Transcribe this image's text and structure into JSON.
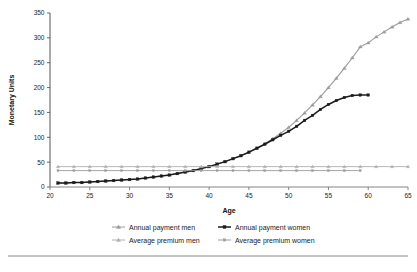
{
  "chart_data": {
    "type": "line",
    "title": "",
    "xlabel": "Age",
    "ylabel": "Monetary Units",
    "xlim": [
      20,
      65
    ],
    "ylim": [
      0,
      350
    ],
    "xticks": [
      20,
      25,
      30,
      35,
      40,
      45,
      50,
      55,
      60,
      65
    ],
    "yticks": [
      0,
      50,
      100,
      150,
      200,
      250,
      300,
      350
    ],
    "grid": false,
    "legend_position": "bottom",
    "legend_columns": 2,
    "series": [
      {
        "name": "Annual payment men",
        "color": "#9a9a9a",
        "marker": "triangle",
        "x": [
          21,
          22,
          23,
          24,
          25,
          26,
          27,
          28,
          29,
          30,
          31,
          32,
          33,
          34,
          35,
          36,
          37,
          38,
          39,
          40,
          41,
          42,
          43,
          44,
          45,
          46,
          47,
          48,
          49,
          50,
          51,
          52,
          53,
          54,
          55,
          56,
          57,
          58,
          59,
          60,
          61,
          62,
          63,
          64,
          65
        ],
        "values": [
          8,
          8,
          9,
          9,
          10,
          11,
          12,
          13,
          14,
          15,
          16,
          18,
          20,
          22,
          24,
          27,
          30,
          33,
          37,
          41,
          46,
          51,
          57,
          63,
          70,
          78,
          87,
          97,
          108,
          120,
          134,
          149,
          165,
          182,
          200,
          219,
          239,
          260,
          282,
          290,
          302,
          312,
          322,
          331,
          338
        ]
      },
      {
        "name": "Annual payment women",
        "color": "#1c1c1c",
        "marker": "square",
        "x": [
          21,
          22,
          23,
          24,
          25,
          26,
          27,
          28,
          29,
          30,
          31,
          32,
          33,
          34,
          35,
          36,
          37,
          38,
          39,
          40,
          41,
          42,
          43,
          44,
          45,
          46,
          47,
          48,
          49,
          50,
          51,
          52,
          53,
          54,
          55,
          56,
          57,
          58,
          59,
          60
        ],
        "values": [
          8,
          8,
          9,
          9,
          10,
          11,
          12,
          13,
          14,
          15,
          16,
          18,
          20,
          22,
          24,
          27,
          30,
          33,
          37,
          41,
          46,
          51,
          57,
          63,
          70,
          78,
          86,
          95,
          104,
          112,
          122,
          134,
          144,
          156,
          166,
          174,
          180,
          184,
          185,
          185
        ]
      },
      {
        "name": "Average premium men",
        "color": "#b0b0b0",
        "marker": "triangle",
        "x": [
          21,
          23,
          25,
          27,
          29,
          31,
          33,
          35,
          37,
          39,
          41,
          43,
          45,
          47,
          49,
          51,
          53,
          55,
          57,
          59,
          61,
          63,
          65
        ],
        "values": [
          41,
          41,
          41,
          41,
          41,
          41,
          41,
          41,
          41,
          41,
          41,
          41,
          41,
          41,
          41,
          41,
          41,
          41,
          41,
          41,
          41,
          41,
          41
        ]
      },
      {
        "name": "Average premium women",
        "color": "#9c9c9c",
        "marker": "square",
        "x": [
          21,
          23,
          25,
          27,
          29,
          31,
          33,
          35,
          37,
          39,
          41,
          43,
          45,
          47,
          49,
          51,
          53,
          55,
          57,
          59
        ],
        "values": [
          33,
          33,
          33,
          33,
          33,
          33,
          33,
          33,
          33,
          33,
          33,
          33,
          33,
          33,
          33,
          33,
          33,
          33,
          33,
          33
        ]
      }
    ]
  },
  "legend": {
    "entries": [
      {
        "label": "Annual payment men"
      },
      {
        "label": "Annual payment women"
      },
      {
        "label": "Average premium men"
      },
      {
        "label": "Average premium women"
      }
    ]
  },
  "footer": {
    "rule_visible": true
  }
}
